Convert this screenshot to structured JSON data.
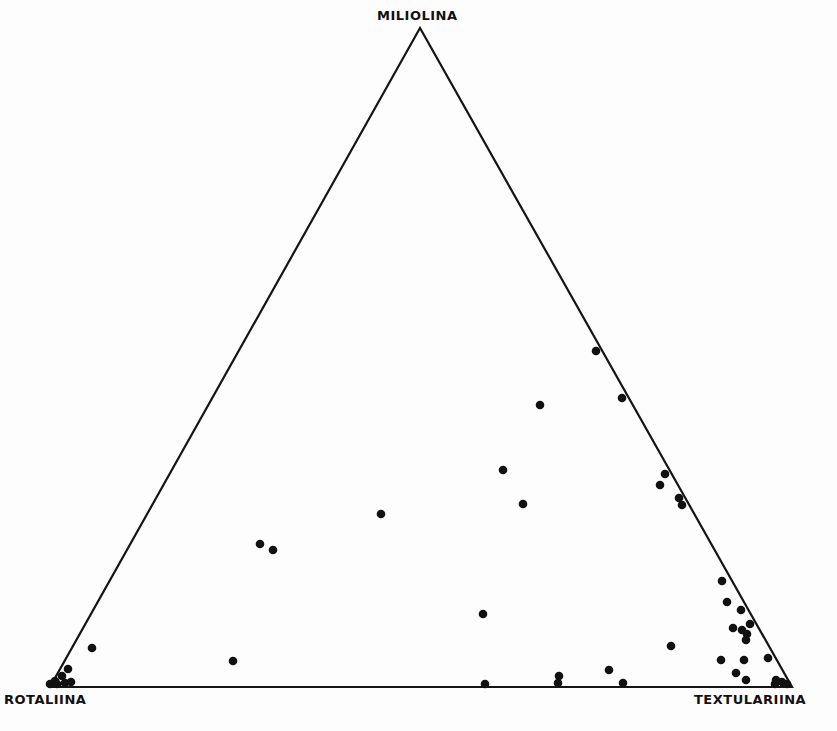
{
  "chart_data": {
    "type": "scatter",
    "subtype": "ternary",
    "title": "",
    "vertices": {
      "top": "MILIOLINA",
      "bottom_left": "ROTALIINA",
      "bottom_right": "TEXTULARIINA"
    },
    "grid": false,
    "legend": null,
    "marker": {
      "shape": "filled-circle",
      "color": "#111111"
    },
    "points_px": [
      [
        596,
        351
      ],
      [
        622,
        398
      ],
      [
        540,
        405
      ],
      [
        503,
        470
      ],
      [
        523,
        504
      ],
      [
        665,
        474
      ],
      [
        660,
        485
      ],
      [
        679,
        498
      ],
      [
        682,
        505
      ],
      [
        381,
        514
      ],
      [
        260,
        544
      ],
      [
        273,
        550
      ],
      [
        722,
        581
      ],
      [
        727,
        602
      ],
      [
        741,
        610
      ],
      [
        750,
        624
      ],
      [
        733,
        628
      ],
      [
        742,
        630
      ],
      [
        747,
        634
      ],
      [
        746,
        640
      ],
      [
        483,
        614
      ],
      [
        671,
        646
      ],
      [
        92,
        648
      ],
      [
        233,
        661
      ],
      [
        721,
        660
      ],
      [
        744,
        660
      ],
      [
        768,
        658
      ],
      [
        736,
        673
      ],
      [
        746,
        680
      ],
      [
        776,
        680
      ],
      [
        782,
        682
      ],
      [
        609,
        670
      ],
      [
        559,
        676
      ],
      [
        558,
        683
      ],
      [
        623,
        683
      ],
      [
        485,
        684
      ],
      [
        68,
        669
      ],
      [
        62,
        676
      ],
      [
        55,
        681
      ],
      [
        50,
        684
      ],
      [
        57,
        684
      ],
      [
        65,
        683
      ],
      [
        71,
        682
      ],
      [
        775,
        684
      ],
      [
        787,
        684
      ]
    ],
    "points_ternary_pct": [
      {
        "miliolina": 51,
        "rotaliina": 0,
        "textulariina": 49
      },
      {
        "miliolina": 44,
        "rotaliina": 0,
        "textulariina": 56
      },
      {
        "miliolina": 43,
        "rotaliina": 16,
        "textulariina": 41
      },
      {
        "miliolina": 33,
        "rotaliina": 25,
        "textulariina": 42
      },
      {
        "miliolina": 28,
        "rotaliina": 24,
        "textulariina": 48
      },
      {
        "miliolina": 32,
        "rotaliina": 2,
        "textulariina": 66
      },
      {
        "miliolina": 31,
        "rotaliina": 4,
        "textulariina": 65
      },
      {
        "miliolina": 29,
        "rotaliina": 2,
        "textulariina": 69
      },
      {
        "miliolina": 27,
        "rotaliina": 2,
        "textulariina": 71
      },
      {
        "miliolina": 26,
        "rotaliina": 44,
        "textulariina": 30
      },
      {
        "miliolina": 22,
        "rotaliina": 60,
        "textulariina": 18
      },
      {
        "miliolina": 21,
        "rotaliina": 59,
        "textulariina": 20
      },
      {
        "miliolina": 16,
        "rotaliina": 1,
        "textulariina": 83
      },
      {
        "miliolina": 13,
        "rotaliina": 3,
        "textulariina": 84
      },
      {
        "miliolina": 12,
        "rotaliina": 1,
        "textulariina": 87
      },
      {
        "miliolina": 10,
        "rotaliina": 1,
        "textulariina": 89
      },
      {
        "miliolina": 9,
        "rotaliina": 3,
        "textulariina": 88
      },
      {
        "miliolina": 9,
        "rotaliina": 2,
        "textulariina": 89
      },
      {
        "miliolina": 8,
        "rotaliina": 2,
        "textulariina": 90
      },
      {
        "miliolina": 7,
        "rotaliina": 2,
        "textulariina": 91
      },
      {
        "miliolina": 11,
        "rotaliina": 40,
        "textulariina": 49
      },
      {
        "miliolina": 6,
        "rotaliina": 13,
        "textulariina": 81
      },
      {
        "miliolina": 6,
        "rotaliina": 91,
        "textulariina": 3
      },
      {
        "miliolina": 4,
        "rotaliina": 73,
        "textulariina": 23
      },
      {
        "miliolina": 4,
        "rotaliina": 7,
        "textulariina": 89
      },
      {
        "miliolina": 4,
        "rotaliina": 4,
        "textulariina": 92
      },
      {
        "miliolina": 4,
        "rotaliina": 1,
        "textulariina": 95
      },
      {
        "miliolina": 2,
        "rotaliina": 6,
        "textulariina": 92
      },
      {
        "miliolina": 1,
        "rotaliina": 5,
        "textulariina": 94
      },
      {
        "miliolina": 1,
        "rotaliina": 2,
        "textulariina": 97
      },
      {
        "miliolina": 1,
        "rotaliina": 1,
        "textulariina": 98
      },
      {
        "miliolina": 3,
        "rotaliina": 22,
        "textulariina": 75
      },
      {
        "miliolina": 2,
        "rotaliina": 28,
        "textulariina": 70
      },
      {
        "miliolina": 1,
        "rotaliina": 29,
        "textulariina": 70
      },
      {
        "miliolina": 1,
        "rotaliina": 23,
        "textulariina": 76
      },
      {
        "miliolina": 0,
        "rotaliina": 41,
        "textulariina": 59
      },
      {
        "miliolina": 3,
        "rotaliina": 96,
        "textulariina": 1
      },
      {
        "miliolina": 2,
        "rotaliina": 97,
        "textulariina": 1
      },
      {
        "miliolina": 1,
        "rotaliina": 99,
        "textulariina": 0
      },
      {
        "miliolina": 0,
        "rotaliina": 100,
        "textulariina": 0
      },
      {
        "miliolina": 0,
        "rotaliina": 98,
        "textulariina": 2
      },
      {
        "miliolina": 1,
        "rotaliina": 97,
        "textulariina": 2
      },
      {
        "miliolina": 1,
        "rotaliina": 96,
        "textulariina": 3
      },
      {
        "miliolina": 0,
        "rotaliina": 2,
        "textulariina": 98
      },
      {
        "miliolina": 0,
        "rotaliina": 0,
        "textulariina": 100
      }
    ]
  },
  "labels": {
    "top": "MILIOLINA",
    "left": "ROTALIINA",
    "right": "TEXTULARIINA"
  }
}
